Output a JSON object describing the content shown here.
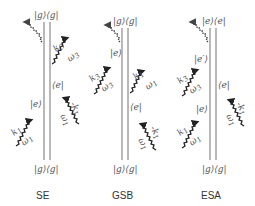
{
  "diagrams": [
    {
      "id": "SE",
      "caption": "SE",
      "top_state": "|g⟩⟨g|",
      "bottom_state": "|g⟩⟨g|",
      "left_state": "|e⟩",
      "right_state": "⟨e|",
      "pulses": [
        {
          "side": "left",
          "k": "k1",
          "w": "ω1"
        },
        {
          "side": "right",
          "k": "-k1",
          "w": "ω1"
        },
        {
          "side": "right",
          "k": "k3",
          "w": "ω3"
        }
      ]
    },
    {
      "id": "GSB",
      "caption": "GSB",
      "top_state": "|g⟩⟨g|",
      "bottom_state": "|g⟩⟨g|",
      "left_state": "|e⟩",
      "right_state": "⟨e|",
      "pulses": [
        {
          "side": "right",
          "k": "-k1",
          "w": "ω1"
        },
        {
          "side": "right",
          "k": "k1",
          "w": "ω1"
        },
        {
          "side": "left",
          "k": "k3",
          "w": "ω3"
        }
      ]
    },
    {
      "id": "ESA",
      "caption": "ESA",
      "top_state": "|e⟩⟨e|",
      "bottom_state": "|g⟩⟨g|",
      "left_state_low": "|e⟩",
      "left_state_high": "|e′⟩",
      "right_state": "⟨e|",
      "pulses": [
        {
          "side": "left",
          "k": "k1",
          "w": "ω1"
        },
        {
          "side": "right",
          "k": "-k1",
          "w": "ω1"
        },
        {
          "side": "left",
          "k": "k3",
          "w": "ω3"
        }
      ]
    }
  ],
  "labels": {
    "k1": "k",
    "k1_sub": "1",
    "mk1": "-k",
    "mk1_sub": "1",
    "k3": "k",
    "k3_sub": "3",
    "w1": "ω",
    "w1_sub": "1",
    "w3": "ω",
    "w3_sub": "3"
  }
}
